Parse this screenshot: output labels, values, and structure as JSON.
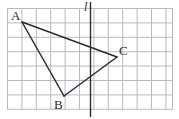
{
  "figure": {
    "width": 179,
    "height": 119,
    "background_color": "#ffffff"
  },
  "grid": {
    "name": "square-grid",
    "line_color": "#b9b9c4",
    "border_color": "#a9a9b6",
    "cell_size": 14.4,
    "left": 7.5,
    "top": 8.5,
    "right": 172.5,
    "bottom": 109.5,
    "columns": 11,
    "rows": 7
  },
  "line_of_reflection": {
    "name": "line-l",
    "label": "l",
    "color": "#2b2b2b",
    "x": 90.5,
    "y1": 2.0,
    "y2": 117.0,
    "stroke_width": 1.4
  },
  "triangle": {
    "name": "triangle-ABC",
    "stroke_color": "#2b2b2b",
    "stroke_width": 1.5,
    "fill": "none",
    "vertices": [
      {
        "label": "A",
        "x": 22,
        "y": 22
      },
      {
        "label": "B",
        "x": 64,
        "y": 96
      },
      {
        "label": "C",
        "x": 117,
        "y": 57
      }
    ],
    "edges": [
      {
        "name": "edge-AC",
        "from": "A",
        "to": "C"
      },
      {
        "name": "edge-AB",
        "from": "A",
        "to": "B"
      },
      {
        "name": "edge-BC",
        "from": "B",
        "to": "C"
      }
    ]
  },
  "labels": {
    "a": "A",
    "b": "B",
    "c": "C",
    "l": "l"
  }
}
